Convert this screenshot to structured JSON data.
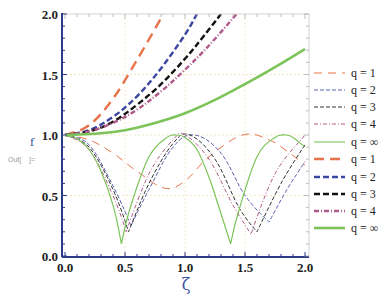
{
  "chart_data": {
    "type": "line",
    "title": "",
    "xlabel": "ζ",
    "ylabel": "f",
    "xlim": [
      0,
      2
    ],
    "ylim": [
      0,
      2
    ],
    "x_ticks": [
      "0.0",
      "0.5",
      "1.0",
      "1.5",
      "2.0"
    ],
    "y_ticks": [
      "0.0",
      "0.5",
      "1.0",
      "1.5",
      "2.0"
    ],
    "grid": true,
    "legend_position": "right",
    "legend": [
      {
        "label": "q = 1",
        "color": "#e8734a",
        "style": "dash-long",
        "weight": "thin"
      },
      {
        "label": "q = 2",
        "color": "#5a62b0",
        "style": "dash",
        "weight": "thin"
      },
      {
        "label": "q = 3",
        "color": "#333333",
        "style": "dash",
        "weight": "thin"
      },
      {
        "label": "q = 4",
        "color": "#b05a8a",
        "style": "dash-dot",
        "weight": "thin"
      },
      {
        "label": "q = ∞",
        "color": "#7cc45a",
        "style": "solid",
        "weight": "thin"
      },
      {
        "label": "q = 1",
        "color": "#e8734a",
        "style": "dash-long",
        "weight": "bold"
      },
      {
        "label": "q = 2",
        "color": "#3a46a0",
        "style": "dash",
        "weight": "bold"
      },
      {
        "label": "q = 3",
        "color": "#111111",
        "style": "dash",
        "weight": "bold"
      },
      {
        "label": "q = 4",
        "color": "#b05a8a",
        "style": "dash-dot",
        "weight": "bold"
      },
      {
        "label": "q = ∞",
        "color": "#7cc45a",
        "style": "solid",
        "weight": "bold"
      }
    ],
    "series": [
      {
        "name": "q = 1 (oscillating)",
        "x": [
          0,
          0.2,
          0.4,
          0.6,
          0.83,
          1.0,
          1.2,
          1.48,
          1.7,
          1.9,
          2.0
        ],
        "y": [
          1.0,
          0.96,
          0.85,
          0.7,
          0.56,
          0.62,
          0.82,
          1.0,
          0.96,
          0.83,
          0.75
        ]
      },
      {
        "name": "q = 2 (oscillating)",
        "x": [
          0,
          0.2,
          0.4,
          0.55,
          0.7,
          0.9,
          1.08,
          1.3,
          1.5,
          1.7,
          1.85,
          2.0
        ],
        "y": [
          1.0,
          0.92,
          0.58,
          0.25,
          0.55,
          0.9,
          1.0,
          0.85,
          0.5,
          0.28,
          0.55,
          0.78
        ]
      },
      {
        "name": "q = 3 (oscillating)",
        "x": [
          0,
          0.2,
          0.4,
          0.53,
          0.7,
          0.9,
          1.04,
          1.25,
          1.45,
          1.6,
          1.8,
          2.0
        ],
        "y": [
          1.0,
          0.9,
          0.55,
          0.2,
          0.6,
          0.93,
          1.0,
          0.8,
          0.4,
          0.2,
          0.6,
          0.92
        ]
      },
      {
        "name": "q = 4 (oscillating)",
        "x": [
          0,
          0.2,
          0.4,
          0.51,
          0.7,
          0.9,
          1.0,
          1.2,
          1.4,
          1.55,
          1.75,
          2.0
        ],
        "y": [
          1.0,
          0.88,
          0.5,
          0.2,
          0.68,
          0.96,
          1.0,
          0.8,
          0.42,
          0.18,
          0.68,
          1.0
        ]
      },
      {
        "name": "q = ∞ (oscillating)",
        "x": [
          0,
          0.1,
          0.2,
          0.3,
          0.4,
          0.47,
          0.55,
          0.7,
          0.85,
          0.93,
          1.0,
          1.1,
          1.2,
          1.3,
          1.38,
          1.45,
          1.6,
          1.75,
          1.84,
          1.9,
          2.0
        ],
        "y": [
          1.0,
          0.97,
          0.88,
          0.7,
          0.42,
          0.1,
          0.42,
          0.82,
          0.98,
          1.0,
          0.98,
          0.88,
          0.65,
          0.35,
          0.1,
          0.38,
          0.82,
          0.98,
          1.0,
          0.98,
          0.9
        ]
      },
      {
        "name": "q = 1 (growing)",
        "x": [
          0,
          0.2,
          0.4,
          0.6,
          0.82
        ],
        "y": [
          1.0,
          1.08,
          1.3,
          1.62,
          2.0
        ]
      },
      {
        "name": "q = 2 (growing)",
        "x": [
          0,
          0.2,
          0.4,
          0.6,
          0.8,
          1.0,
          1.1
        ],
        "y": [
          1.0,
          1.04,
          1.15,
          1.32,
          1.55,
          1.83,
          2.0
        ]
      },
      {
        "name": "q = 3 (growing)",
        "x": [
          0,
          0.2,
          0.4,
          0.6,
          0.8,
          1.0,
          1.15,
          1.3
        ],
        "y": [
          1.0,
          1.03,
          1.11,
          1.25,
          1.42,
          1.63,
          1.81,
          2.0
        ]
      },
      {
        "name": "q = 4 (growing)",
        "x": [
          0,
          0.2,
          0.4,
          0.6,
          0.8,
          1.0,
          1.2,
          1.43
        ],
        "y": [
          1.0,
          1.03,
          1.1,
          1.21,
          1.36,
          1.54,
          1.74,
          2.0
        ]
      },
      {
        "name": "q = ∞ (growing)",
        "x": [
          0,
          0.25,
          0.5,
          0.75,
          1.0,
          1.25,
          1.5,
          1.75,
          2.0
        ],
        "y": [
          1.0,
          1.01,
          1.04,
          1.1,
          1.18,
          1.29,
          1.42,
          1.56,
          1.71
        ]
      }
    ]
  },
  "frame": {
    "out_label": "Out[",
    "out_suffix": "]="
  }
}
